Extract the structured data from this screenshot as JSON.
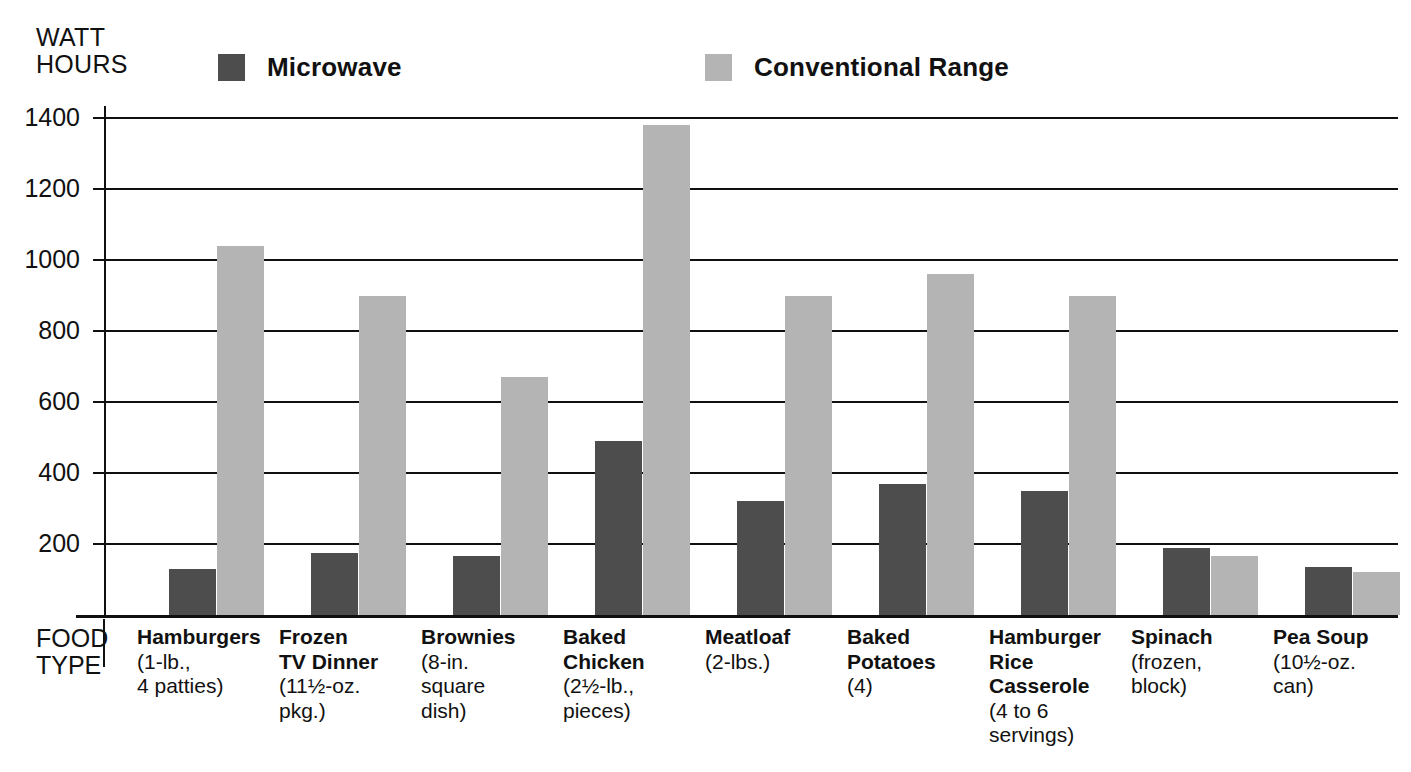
{
  "axis_title": "WATT\nHOURS",
  "food_type_label": "FOOD\nTYPE",
  "legend": {
    "items": [
      {
        "label": "Microwave",
        "color": "#4d4d4d"
      },
      {
        "label": "Conventional Range",
        "color": "#b4b4b4"
      }
    ]
  },
  "y_ticks": [
    {
      "label": "1400",
      "value": 1400
    },
    {
      "label": "1200",
      "value": 1200
    },
    {
      "label": "1000",
      "value": 1000
    },
    {
      "label": "800",
      "value": 800
    },
    {
      "label": "600",
      "value": 600
    },
    {
      "label": "400",
      "value": 400
    },
    {
      "label": "200",
      "value": 200
    }
  ],
  "categories": [
    {
      "name": "Hamburgers",
      "sub": "(1-lb.,\n4 patties)"
    },
    {
      "name": "Frozen\nTV Dinner",
      "sub": "(11½-oz.\npkg.)"
    },
    {
      "name": "Brownies",
      "sub": "(8-in.\nsquare\ndish)"
    },
    {
      "name": "Baked\nChicken",
      "sub": "(2½-lb.,\npieces)"
    },
    {
      "name": "Meatloaf",
      "sub": "(2-lbs.)"
    },
    {
      "name": "Baked\nPotatoes",
      "sub": "(4)"
    },
    {
      "name": "Hamburger\nRice\nCasserole",
      "sub": "(4 to 6\nservings)"
    },
    {
      "name": "Spinach",
      "sub": "(frozen,\nblock)"
    },
    {
      "name": "Pea Soup",
      "sub": "(10½-oz.\ncan)"
    }
  ],
  "chart_data": {
    "type": "bar",
    "title": "",
    "xlabel": "FOOD TYPE",
    "ylabel": "WATT HOURS",
    "ylim": [
      0,
      1400
    ],
    "ytick_step": 200,
    "grid": true,
    "legend_position": "top",
    "categories": [
      "Hamburgers (1-lb., 4 patties)",
      "Frozen TV Dinner (11½-oz. pkg.)",
      "Brownies (8-in. square dish)",
      "Baked Chicken (2½-lb., pieces)",
      "Meatloaf (2-lbs.)",
      "Baked Potatoes (4)",
      "Hamburger Rice Casserole (4 to 6 servings)",
      "Spinach (frozen, block)",
      "Pea Soup (10½-oz. can)"
    ],
    "series": [
      {
        "name": "Microwave",
        "color": "#4d4d4d",
        "values": [
          130,
          175,
          165,
          490,
          320,
          370,
          350,
          190,
          135
        ]
      },
      {
        "name": "Conventional Range",
        "color": "#b4b4b4",
        "values": [
          1040,
          900,
          670,
          1380,
          900,
          960,
          900,
          165,
          120
        ]
      }
    ]
  },
  "layout": {
    "plot_width": 1292,
    "plot_height": 497,
    "group_step": 142.0,
    "group_first_left": 63,
    "bar_width": 47,
    "bar_gap": 1
  }
}
